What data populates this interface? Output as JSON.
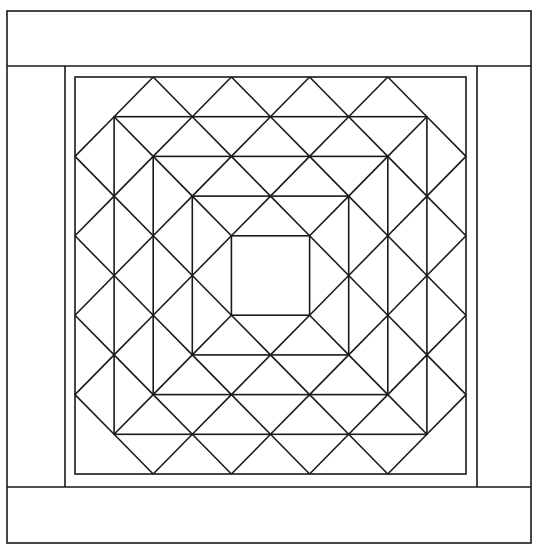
{
  "colors": {
    "line": "#1a1a1a",
    "background": "#ffffff"
  },
  "outer_border": {
    "x1": 7,
    "y1": 11,
    "x2": 531,
    "y2": 543
  },
  "bands": {
    "top": {
      "x1": 7,
      "y1": 11,
      "x2": 531,
      "y2": 66
    },
    "bottom": {
      "x1": 7,
      "y1": 487,
      "x2": 531,
      "y2": 543
    },
    "left": {
      "x1": 7,
      "y1": 66,
      "x2": 65,
      "y2": 487
    },
    "right": {
      "x1": 477,
      "y1": 66,
      "x2": 531,
      "y2": 487
    }
  },
  "inner_strip": {
    "x1": 65,
    "y1": 66,
    "x2": 477,
    "y2": 487
  },
  "frame": {
    "x1": 75,
    "y1": 77,
    "x2": 466,
    "y2": 474,
    "divisions": 10
  },
  "concentric_square_insets": [
    0,
    1,
    2,
    3,
    4
  ],
  "diamond_ring": {
    "min": 2,
    "max": 8
  }
}
